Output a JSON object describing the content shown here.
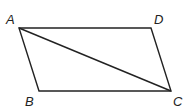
{
  "diagram": {
    "type": "parallelogram with diagonal",
    "vertices": {
      "A": {
        "label": "A",
        "x": 19,
        "y": 28
      },
      "B": {
        "label": "B",
        "x": 39,
        "y": 91
      },
      "C": {
        "label": "C",
        "x": 171,
        "y": 91
      },
      "D": {
        "label": "D",
        "x": 151,
        "y": 28
      }
    },
    "segments": [
      "AD",
      "DC",
      "CB",
      "BA",
      "AC"
    ],
    "stroke_color": "#222222"
  }
}
